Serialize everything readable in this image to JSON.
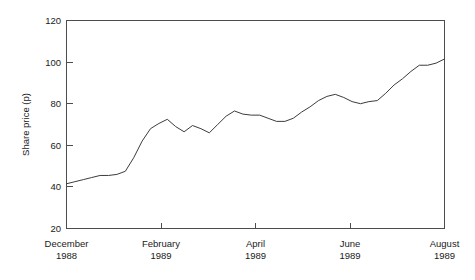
{
  "chart_data": {
    "type": "line",
    "title": "",
    "subtitle": "",
    "xlabel": "",
    "ylabel": "Share price (p)",
    "ylim": [
      20,
      120
    ],
    "yticks": [
      20,
      40,
      60,
      80,
      100,
      120
    ],
    "ytick_labels": [
      "20",
      "40",
      "60",
      "80",
      "100",
      "120"
    ],
    "xlim": [
      0,
      36
    ],
    "xticks": [
      0,
      9,
      18,
      27,
      36
    ],
    "xtick_labels": [
      {
        "month": "December",
        "year": "1988"
      },
      {
        "month": "February",
        "year": "1989"
      },
      {
        "month": "April",
        "year": "1989"
      },
      {
        "month": "June",
        "year": "1989"
      },
      {
        "month": "August",
        "year": "1989"
      }
    ],
    "grid": false,
    "legend": "none",
    "series": [
      {
        "name": "Share price",
        "color": "#3c3c3c",
        "x": [
          0,
          1,
          2,
          3,
          4,
          5,
          6,
          7,
          8,
          9,
          10,
          11,
          12,
          13,
          14,
          15,
          16,
          17,
          18,
          19,
          20,
          21,
          22,
          23,
          24,
          25,
          26,
          27,
          28,
          29,
          30,
          31,
          32,
          33,
          34,
          35,
          36
        ],
        "values": [
          41.5,
          42.5,
          43.5,
          44.5,
          45.5,
          45.5,
          46,
          47.5,
          54,
          62,
          68,
          70.5,
          72.5,
          69,
          66.5,
          69.5,
          68,
          66,
          70,
          74,
          76.5,
          75,
          74.5,
          74.5,
          73,
          71.5,
          71.5,
          73,
          76,
          78.5,
          81.5,
          83.5,
          84.5,
          83,
          81,
          80,
          81
        ]
      }
    ],
    "values_extended": [
      81.5,
      85,
      89,
      92,
      95.5,
      98.5,
      98.5,
      99.5,
      101.5
    ]
  },
  "axes": {
    "y_axis_title": "Share price (p)",
    "y_tick_labels": [
      "120",
      "100",
      "80",
      "60",
      "40",
      "20"
    ],
    "x_tick_months": [
      "December",
      "February",
      "April",
      "June",
      "August"
    ],
    "x_tick_years": [
      "1988",
      "1989",
      "1989",
      "1989",
      "1989"
    ]
  },
  "colors": {
    "line": "#3c3c3c",
    "frame": "#4d4d4d",
    "background": "#ffffff",
    "text": "#1a1a1a"
  }
}
